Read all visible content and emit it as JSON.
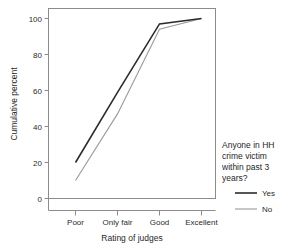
{
  "chart_data": {
    "type": "line",
    "title": "",
    "subtitle": "",
    "xlabel": "Rating of judges",
    "ylabel": "Cumulative percent",
    "categories": [
      "Poor",
      "Only fair",
      "Good",
      "Excellent"
    ],
    "yticks": [
      "0",
      "20",
      "40",
      "60",
      "80",
      "100"
    ],
    "ytick_values": [
      0,
      20,
      40,
      60,
      80,
      100
    ],
    "ylim": [
      0,
      104
    ],
    "grid": false,
    "legend_position": "right",
    "legend_title": "Anyone in HH crime victim within past 3 years?",
    "legend_title_lines": [
      "Anyone in HH",
      "crime victim",
      "within past 3",
      "years?"
    ],
    "series": [
      {
        "name": "Yes",
        "color": "#2c2c2c",
        "width": 1.6,
        "values": [
          20,
          59,
          97,
          100
        ]
      },
      {
        "name": "No",
        "color": "#9a9a9a",
        "width": 1.1,
        "values": [
          10,
          47,
          94,
          100
        ]
      }
    ]
  },
  "axes": {
    "y_title": "Cumulative percent",
    "x_title": "Rating of judges"
  },
  "legend": {
    "title_lines": [
      "Anyone in HH",
      "crime victim",
      "within past 3",
      "years?"
    ],
    "entries": [
      {
        "label": "Yes",
        "color": "#2c2c2c"
      },
      {
        "label": "No",
        "color": "#9a9a9a"
      }
    ]
  },
  "colors": {
    "frame": "#8c8c8c",
    "text": "#1f1f1f",
    "series_yes": "#2c2c2c",
    "series_no": "#9a9a9a",
    "background": "#ffffff"
  }
}
